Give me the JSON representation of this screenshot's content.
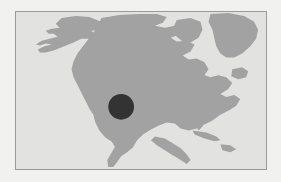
{
  "figure": {
    "kind": "static-map-image"
  },
  "canvas": {
    "width": 281,
    "height": 182,
    "background_color": "#f1f1f0"
  },
  "map_panel": {
    "left": 15,
    "top": 11,
    "width": 252,
    "height": 159,
    "border_color": "#9a9a9a",
    "border_width": 1,
    "ocean_color": "#e2e2e1",
    "land_color": "#a2a2a2",
    "projection_extent": {
      "west": -170,
      "east": -20,
      "south": 5,
      "north": 80
    }
  },
  "marker": {
    "label": "highlighted region",
    "shape": "circle",
    "color": "#333333",
    "center_x": 121,
    "center_y": 107,
    "radius": 13,
    "approx_location": "southwestern United States"
  },
  "landmasses": [
    {
      "name": "Alaska"
    },
    {
      "name": "Canada"
    },
    {
      "name": "Greenland"
    },
    {
      "name": "United States"
    },
    {
      "name": "Mexico"
    },
    {
      "name": "Central America"
    },
    {
      "name": "Cuba"
    },
    {
      "name": "Hispaniola"
    },
    {
      "name": "Baffin Island"
    },
    {
      "name": "Newfoundland"
    }
  ],
  "annotations": {
    "labels_visible": false,
    "gridlines_visible": false,
    "legend_visible": false,
    "axis_ticks_visible": false
  }
}
